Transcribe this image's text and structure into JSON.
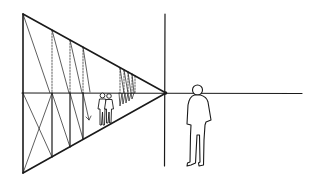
{
  "diagram": {
    "type": "one-point perspective sketch",
    "description": "Line drawing showing a one-point perspective corridor converging to a vanishing point on the horizon, with receding figures inside the corridor and a larger standing figure in the foreground to the right.",
    "colors": {
      "background": "#ffffff",
      "ink": "#1a1a1a"
    },
    "elements": {
      "horizon_line": "horizon line",
      "vanishing_point": "vanishing point",
      "picture_plane_vertical": "vertical reference line",
      "corridor": "receding corridor (triangular perspective frame)",
      "foreground_figure": "standing person (foreground)",
      "background_figures": "people walking inside corridor"
    }
  }
}
